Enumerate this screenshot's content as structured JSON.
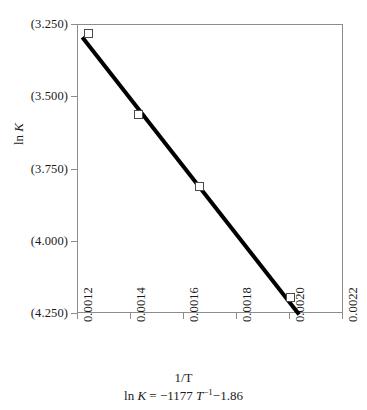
{
  "chart_data": {
    "type": "scatter",
    "title": "",
    "xlabel": "1/T",
    "ylabel": "ln K",
    "annotation": "ln K = −1177 T⁻¹−1.86",
    "annotation_parts": {
      "lead": "ln ",
      "k": "K",
      "eq": " = −1177 ",
      "t": "T",
      "exp": "−1",
      "tail": "−1.86"
    },
    "grid": false,
    "legend": "none",
    "xlim": [
      0.0012,
      0.0022
    ],
    "ylim": [
      -4.25,
      -3.25
    ],
    "y_axis_note": "values displayed in parentheses denoting negative numbers",
    "xticks": [
      0.0012,
      0.0014,
      0.0016,
      0.0018,
      0.002,
      0.0022
    ],
    "xtick_labels": [
      "0.0012",
      "0.0014",
      "0.0016",
      "0.0018",
      "0.0020",
      "0.0022"
    ],
    "yticks": [
      -3.25,
      -3.5,
      -3.75,
      -4.0,
      -4.25
    ],
    "ytick_labels": [
      "(3.250)",
      "(3.500)",
      "(3.750)",
      "(4.000)",
      "(4.250)"
    ],
    "x": [
      0.001243,
      0.001432,
      0.001662,
      0.002001
    ],
    "y": [
      -3.283,
      -3.562,
      -3.813,
      -4.198
    ],
    "marker": "open-square",
    "series": [
      {
        "name": "ln K vs 1/T",
        "x": [
          0.001243,
          0.001432,
          0.001662,
          0.002001
        ],
        "values": [
          -3.283,
          -3.562,
          -3.813,
          -4.198
        ]
      }
    ],
    "fit_line": {
      "type": "line",
      "slope": -1177,
      "intercept": -1.86,
      "x_start": 0.00122,
      "x_end": 0.002035,
      "y_start": -3.2959,
      "y_end": -4.2552,
      "color": "#000000",
      "width": 4
    },
    "colors": {
      "line": "#000000",
      "marker_edge": "#4a4a4a",
      "marker_fill": "#ffffff",
      "axis": "#8c8c8c",
      "text": "#1a1a1a",
      "background": "#ffffff"
    }
  }
}
